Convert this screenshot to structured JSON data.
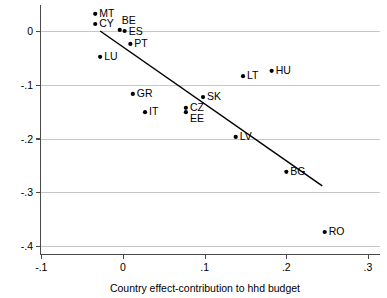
{
  "chart_data": {
    "type": "scatter",
    "title": "",
    "xlabel": "Country effect-contribution to hhd budget",
    "ylabel": "",
    "xlim": [
      -0.1,
      0.3
    ],
    "ylim": [
      -0.4,
      0.05
    ],
    "grid": "horizontal",
    "legend": "none",
    "xticks": [
      "-.1",
      "0",
      ".1",
      ".2",
      ".3"
    ],
    "xtick_values": [
      -0.1,
      0,
      0.1,
      0.2,
      0.3
    ],
    "yticks": [
      "0",
      "-.1",
      "-.2",
      "-.3",
      "-.4"
    ],
    "ytick_values": [
      0,
      -0.1,
      -0.2,
      -0.3,
      -0.4
    ],
    "points": [
      {
        "label": "MT",
        "x": -0.034,
        "y": 0.032,
        "label_dx": 4,
        "label_dy": 0
      },
      {
        "label": "CY",
        "x": -0.034,
        "y": 0.013,
        "label_dx": 4,
        "label_dy": 0
      },
      {
        "label": "BE",
        "x": -0.004,
        "y": 0.002,
        "label_dx": 2,
        "label_dy": -9
      },
      {
        "label": "ES",
        "x": 0.002,
        "y": 0.0,
        "label_dx": 4,
        "label_dy": 1
      },
      {
        "label": "PT",
        "x": 0.009,
        "y": -0.024,
        "label_dx": 4,
        "label_dy": 0
      },
      {
        "label": "LU",
        "x": -0.028,
        "y": -0.048,
        "label_dx": 4,
        "label_dy": 0
      },
      {
        "label": "GR",
        "x": 0.012,
        "y": -0.117,
        "label_dx": 4,
        "label_dy": 0
      },
      {
        "label": "IT",
        "x": 0.027,
        "y": -0.151,
        "label_dx": 4,
        "label_dy": 0
      },
      {
        "label": "CZ",
        "x": 0.077,
        "y": -0.143,
        "label_dx": 4,
        "label_dy": 0
      },
      {
        "label": "EE",
        "x": 0.077,
        "y": -0.151,
        "label_dx": 4,
        "label_dy": 7
      },
      {
        "label": "SK",
        "x": 0.098,
        "y": -0.123,
        "label_dx": 4,
        "label_dy": 0
      },
      {
        "label": "LT",
        "x": 0.147,
        "y": -0.084,
        "label_dx": 4,
        "label_dy": 0
      },
      {
        "label": "HU",
        "x": 0.182,
        "y": -0.074,
        "label_dx": 4,
        "label_dy": 0
      },
      {
        "label": "LV",
        "x": 0.138,
        "y": -0.197,
        "label_dx": 4,
        "label_dy": 0
      },
      {
        "label": "BG",
        "x": 0.2,
        "y": -0.262,
        "label_dx": 4,
        "label_dy": 0
      },
      {
        "label": "RO",
        "x": 0.247,
        "y": -0.374,
        "label_dx": 4,
        "label_dy": 0
      }
    ],
    "fit_line": {
      "x_start": -0.028,
      "y_start": 0.0,
      "x_end": 0.244,
      "y_end": -0.288
    },
    "colors": {
      "marker": "#000000",
      "fit_line": "#000000",
      "grid": "#b9b9b9",
      "axis": "#4a4a4a",
      "background": "#ffffff",
      "text": "#000000"
    }
  }
}
